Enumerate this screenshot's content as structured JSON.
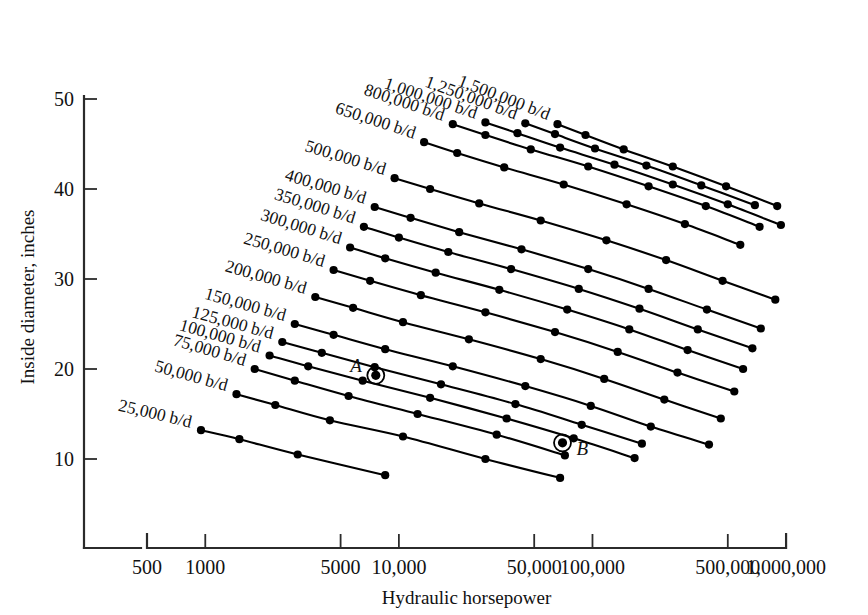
{
  "chart_data": {
    "type": "line",
    "title": "",
    "xlabel": "Hydraulic horsepower",
    "ylabel": "Inside diameter, inches",
    "xscale": "log",
    "yscale": "linear",
    "xlim": [
      500,
      1000000
    ],
    "ylim": [
      0,
      50
    ],
    "grid": false,
    "legend_position": "inline-curve-labels",
    "xticks": [
      {
        "value": 500,
        "label": "500"
      },
      {
        "value": 1000,
        "label": "1000"
      },
      {
        "value": 5000,
        "label": "5000"
      },
      {
        "value": 10000,
        "label": "10,000"
      },
      {
        "value": 50000,
        "label": "50,000"
      },
      {
        "value": 100000,
        "label": "100,000"
      },
      {
        "value": 500000,
        "label": "500,000"
      },
      {
        "value": 1000000,
        "label": "1,000,000"
      }
    ],
    "yticks": [
      {
        "value": 10,
        "label": "10"
      },
      {
        "value": 20,
        "label": "20"
      },
      {
        "value": 30,
        "label": "30"
      },
      {
        "value": 40,
        "label": "40"
      },
      {
        "value": 50,
        "label": "50"
      }
    ],
    "series": [
      {
        "name": "25,000 b/d",
        "label": "25,000 b/d",
        "x": [
          950,
          1500,
          3000,
          8500
        ],
        "y": [
          13.2,
          12.2,
          10.5,
          8.2
        ]
      },
      {
        "name": "50,000 b/d",
        "label": "50,000 b/d",
        "x": [
          1450,
          2300,
          4400,
          10500,
          28000,
          68000
        ],
        "y": [
          17.2,
          16.0,
          14.3,
          12.5,
          10.0,
          7.9
        ]
      },
      {
        "name": "75,000 b/d",
        "label": "75,000 b/d",
        "x": [
          1800,
          2900,
          5500,
          12500,
          32000,
          72000
        ],
        "y": [
          20.0,
          18.7,
          17.0,
          15.0,
          12.7,
          10.4
        ]
      },
      {
        "name": "100,000 b/d",
        "label": "100,000 b/d",
        "x": [
          2150,
          3400,
          6500,
          14500,
          36000,
          80000,
          165000
        ],
        "y": [
          21.5,
          20.3,
          18.7,
          16.8,
          14.5,
          12.3,
          10.1
        ]
      },
      {
        "name": "125,000 b/d",
        "label": "125,000 b/d",
        "x": [
          2500,
          4000,
          7500,
          16500,
          40000,
          88000,
          180000
        ],
        "y": [
          23.0,
          21.8,
          20.2,
          18.3,
          16.1,
          13.8,
          11.7
        ]
      },
      {
        "name": "150,000 b/d",
        "label": "150,000 b/d",
        "x": [
          2900,
          4600,
          8500,
          19000,
          45000,
          98000,
          200000,
          400000
        ],
        "y": [
          25.0,
          23.8,
          22.2,
          20.3,
          18.1,
          15.9,
          13.6,
          11.6
        ]
      },
      {
        "name": "200,000 b/d",
        "label": "200,000 b/d",
        "x": [
          3700,
          5800,
          10500,
          23000,
          54000,
          115000,
          235000,
          460000
        ],
        "y": [
          28.0,
          26.8,
          25.2,
          23.3,
          21.1,
          18.9,
          16.6,
          14.5
        ]
      },
      {
        "name": "250,000 b/d",
        "label": "250,000 b/d",
        "x": [
          4600,
          7100,
          13000,
          28000,
          64000,
          135000,
          275000,
          540000
        ],
        "y": [
          31.0,
          29.8,
          28.2,
          26.3,
          24.1,
          21.9,
          19.6,
          17.5
        ]
      },
      {
        "name": "300,000 b/d",
        "label": "300,000 b/d",
        "x": [
          5600,
          8500,
          15500,
          33000,
          74000,
          155000,
          310000,
          600000
        ],
        "y": [
          33.5,
          32.3,
          30.7,
          28.8,
          26.6,
          24.4,
          22.1,
          20.0
        ]
      },
      {
        "name": "350,000 b/d",
        "label": "350,000 b/d",
        "x": [
          6600,
          10000,
          18000,
          38000,
          85000,
          175000,
          350000,
          670000
        ],
        "y": [
          35.8,
          34.6,
          33.0,
          31.1,
          28.9,
          26.7,
          24.4,
          22.3
        ]
      },
      {
        "name": "400,000 b/d",
        "label": "400,000 b/d",
        "x": [
          7500,
          11500,
          20500,
          43000,
          95000,
          195000,
          390000,
          740000
        ],
        "y": [
          38.0,
          36.8,
          35.2,
          33.3,
          31.1,
          28.9,
          26.6,
          24.5
        ]
      },
      {
        "name": "500,000 b/d",
        "label": "500,000 b/d",
        "x": [
          9500,
          14500,
          26000,
          54000,
          118000,
          240000,
          470000,
          880000
        ],
        "y": [
          41.2,
          40.0,
          38.4,
          36.5,
          34.3,
          32.1,
          29.8,
          27.7
        ]
      },
      {
        "name": "650,000 b/d",
        "label": "650,000 b/d",
        "x": [
          13500,
          20000,
          35000,
          71000,
          150000,
          300000,
          580000
        ],
        "y": [
          45.2,
          44.0,
          42.4,
          40.5,
          38.3,
          36.1,
          33.8
        ]
      },
      {
        "name": "800,000 b/d",
        "label": "800,000 b/d",
        "x": [
          19000,
          28000,
          48000,
          95000,
          195000,
          385000,
          730000
        ],
        "y": [
          47.2,
          46.0,
          44.4,
          42.5,
          40.3,
          38.1,
          35.8
        ]
      },
      {
        "name": "1,000,000 b/d",
        "label": "1,000,000 b/d",
        "x": [
          28000,
          41000,
          68000,
          130000,
          260000,
          500000,
          940000
        ],
        "y": [
          47.4,
          46.2,
          44.6,
          42.7,
          40.5,
          38.3,
          36.0
        ]
      },
      {
        "name": "1,250,000 b/d",
        "label": "1,250,000 b/d",
        "x": [
          45000,
          64000,
          103000,
          190000,
          365000,
          690000
        ],
        "y": [
          47.3,
          46.1,
          44.5,
          42.6,
          40.4,
          38.2
        ]
      },
      {
        "name": "1,500,000 b/d",
        "label": "1,500,000 b/d",
        "x": [
          66000,
          92000,
          145000,
          260000,
          490000,
          900000
        ],
        "y": [
          47.2,
          46.0,
          44.4,
          42.5,
          40.3,
          38.1
        ]
      }
    ],
    "annotations": [
      {
        "name": "A",
        "label": "A",
        "x": 7600,
        "y": 19.3,
        "label_side": "left"
      },
      {
        "name": "B",
        "label": "B",
        "x": 70000,
        "y": 11.8,
        "label_side": "right"
      }
    ]
  },
  "colors": {
    "curve": "#000000",
    "axis": "#2b2b2b",
    "text": "#111111",
    "background": "#ffffff"
  }
}
